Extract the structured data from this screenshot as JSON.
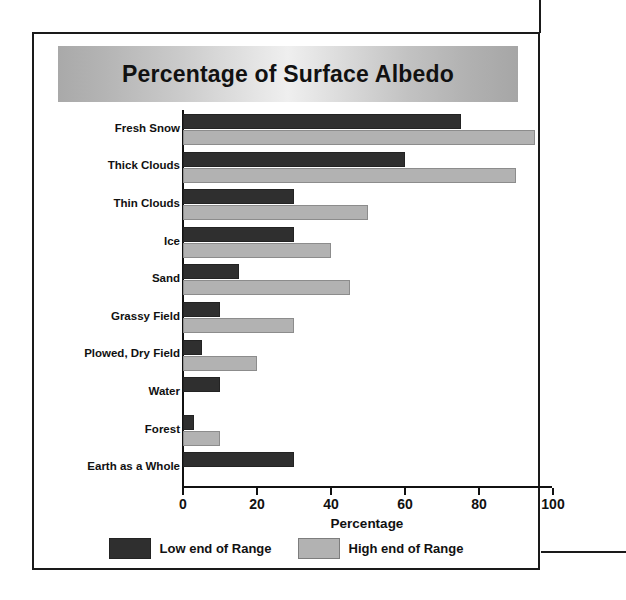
{
  "figure": {
    "title": "Percentage of Surface Albedo"
  },
  "legend": {
    "items": [
      {
        "label": "Low end of Range",
        "key": "low",
        "color": "#2f2f2f"
      },
      {
        "label": "High end of Range",
        "key": "high",
        "color": "#b2b2b2"
      }
    ]
  },
  "axis": {
    "x_title": "Percentage",
    "ticks": [
      "0",
      "20",
      "40",
      "60",
      "80",
      "100"
    ]
  },
  "chart_data": {
    "type": "bar",
    "orientation": "horizontal",
    "title": "Percentage of Surface Albedo",
    "xlabel": "Percentage",
    "ylabel": "",
    "xlim": [
      0,
      100
    ],
    "xticks": [
      0,
      20,
      40,
      60,
      80,
      100
    ],
    "grid": false,
    "legend_position": "bottom",
    "categories": [
      "Fresh Snow",
      "Thick Clouds",
      "Thin Clouds",
      "Ice",
      "Sand",
      "Grassy Field",
      "Plowed, Dry Field",
      "Water",
      "Forest",
      "Earth as a Whole"
    ],
    "series": [
      {
        "name": "Low end of Range",
        "color": "#2f2f2f",
        "values": [
          75,
          60,
          30,
          30,
          15,
          10,
          5,
          10,
          3,
          30
        ]
      },
      {
        "name": "High end of Range",
        "color": "#b2b2b2",
        "values": [
          95,
          90,
          50,
          40,
          45,
          30,
          20,
          null,
          10,
          null
        ]
      }
    ]
  }
}
